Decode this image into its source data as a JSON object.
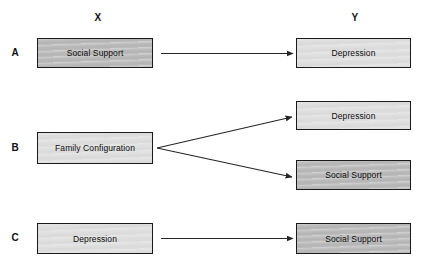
{
  "diagram": {
    "title_absent": true,
    "columns": [
      {
        "id": "x",
        "label": "X"
      },
      {
        "id": "y",
        "label": "Y"
      }
    ],
    "rows": [
      {
        "id": "a",
        "label": "A",
        "predictors": [
          {
            "id": "a-x",
            "label": "Social Support",
            "shade": "dark"
          }
        ],
        "outcomes": [
          {
            "id": "a-y",
            "label": "Depression",
            "shade": "light"
          }
        ],
        "arrows": 1
      },
      {
        "id": "b",
        "label": "B",
        "predictors": [
          {
            "id": "b-x",
            "label": "Family Configuration",
            "shade": "light"
          }
        ],
        "outcomes": [
          {
            "id": "b-y1",
            "label": "Depression",
            "shade": "light"
          },
          {
            "id": "b-y2",
            "label": "Social Support",
            "shade": "dark"
          }
        ],
        "arrows": 2
      },
      {
        "id": "c",
        "label": "C",
        "predictors": [
          {
            "id": "c-x",
            "label": "Depression",
            "shade": "light"
          }
        ],
        "outcomes": [
          {
            "id": "c-y",
            "label": "Social Support",
            "shade": "dark"
          }
        ],
        "arrows": 1
      }
    ],
    "colors": {
      "background": "#ffffff",
      "box_border": "#1a1a1a",
      "box_fill_dark": "#bdbdbd",
      "box_fill_light": "#dedede",
      "arrow": "#262626",
      "text": "#0d0d0d"
    }
  }
}
